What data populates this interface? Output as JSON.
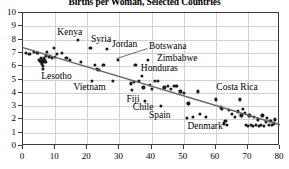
{
  "chart_data": {
    "type": "scatter",
    "title": "Births per Woman, Selected Countries",
    "xlabel": "",
    "ylabel": "",
    "xlim": [
      0,
      80
    ],
    "ylim": [
      0,
      10
    ],
    "xticks": [
      0,
      10,
      20,
      30,
      40,
      50,
      60,
      70,
      80
    ],
    "yticks": [
      0,
      1,
      2,
      3,
      4,
      5,
      6,
      7,
      8,
      9,
      10
    ],
    "grid": true,
    "legend": "none",
    "point_color": "#1a1a1a",
    "trendline_color": "#666666",
    "trendline": {
      "x": [
        0,
        80
      ],
      "y": [
        7.4,
        1.6
      ]
    },
    "points": [
      [
        1.0,
        7.0
      ],
      [
        2.0,
        6.9
      ],
      [
        3.5,
        7.1
      ],
      [
        4.5,
        7.0
      ],
      [
        5.0,
        6.5
      ],
      [
        5.2,
        6.4
      ],
      [
        5.5,
        6.3
      ],
      [
        5.6,
        6.6
      ],
      [
        5.8,
        6.2
      ],
      [
        6.0,
        6.5
      ],
      [
        6.1,
        6.3
      ],
      [
        6.2,
        6.0
      ],
      [
        6.3,
        5.8
      ],
      [
        6.4,
        6.4
      ],
      [
        6.5,
        6.6
      ],
      [
        6.8,
        6.5
      ],
      [
        7.0,
        6.3
      ],
      [
        7.2,
        6.8
      ],
      [
        7.5,
        7.1
      ],
      [
        8.0,
        6.7
      ],
      [
        8.5,
        6.8
      ],
      [
        9.0,
        6.6
      ],
      [
        9.5,
        7.4
      ],
      [
        10.0,
        6.7
      ],
      [
        10.5,
        6.9
      ],
      [
        12.0,
        7.0
      ],
      [
        13.5,
        6.6
      ],
      [
        14.5,
        6.5
      ],
      [
        17.0,
        8.0
      ],
      [
        18.0,
        6.3
      ],
      [
        21.0,
        7.4
      ],
      [
        22.5,
        6.1
      ],
      [
        23.0,
        5.8
      ],
      [
        23.5,
        5.7
      ],
      [
        21.5,
        4.9
      ],
      [
        25.0,
        6.1
      ],
      [
        26.0,
        7.3
      ],
      [
        28.0,
        4.9
      ],
      [
        29.5,
        6.5
      ],
      [
        33.5,
        4.7
      ],
      [
        34.0,
        4.2
      ],
      [
        34.5,
        4.8
      ],
      [
        35.0,
        6.1
      ],
      [
        36.0,
        4.9
      ],
      [
        37.0,
        5.3
      ],
      [
        37.5,
        4.4
      ],
      [
        38.0,
        3.4
      ],
      [
        39.0,
        6.5
      ],
      [
        39.5,
        4.6
      ],
      [
        40.0,
        4.3
      ],
      [
        41.0,
        4.9
      ],
      [
        42.0,
        4.9
      ],
      [
        43.0,
        3.0
      ],
      [
        44.0,
        4.4
      ],
      [
        45.0,
        4.5
      ],
      [
        46.0,
        4.3
      ],
      [
        47.0,
        4.5
      ],
      [
        47.5,
        4.5
      ],
      [
        48.0,
        4.5
      ],
      [
        49.0,
        4.1
      ],
      [
        50.0,
        4.0
      ],
      [
        51.0,
        2.1
      ],
      [
        51.5,
        3.2
      ],
      [
        53.0,
        2.2
      ],
      [
        54.5,
        4.1
      ],
      [
        55.0,
        2.4
      ],
      [
        57.0,
        2.2
      ],
      [
        60.0,
        3.5
      ],
      [
        61.5,
        2.9
      ],
      [
        62.0,
        2.8
      ],
      [
        62.5,
        1.7
      ],
      [
        63.0,
        1.9
      ],
      [
        63.5,
        1.6
      ],
      [
        64.0,
        2.7
      ],
      [
        65.0,
        2.4
      ],
      [
        66.0,
        2.2
      ],
      [
        67.0,
        2.6
      ],
      [
        67.5,
        3.5
      ],
      [
        68.0,
        2.3
      ],
      [
        68.5,
        2.8
      ],
      [
        69.0,
        2.5
      ],
      [
        69.5,
        1.6
      ],
      [
        70.0,
        1.5
      ],
      [
        70.5,
        2.3
      ],
      [
        71.0,
        1.6
      ],
      [
        71.5,
        1.5
      ],
      [
        72.0,
        2.2
      ],
      [
        72.5,
        1.6
      ],
      [
        73.0,
        2.0
      ],
      [
        73.5,
        1.5
      ],
      [
        74.0,
        1.6
      ],
      [
        74.5,
        2.3
      ],
      [
        75.0,
        1.5
      ],
      [
        75.5,
        1.8
      ],
      [
        76.0,
        2.1
      ],
      [
        76.5,
        1.6
      ],
      [
        77.0,
        1.9
      ],
      [
        77.5,
        1.6
      ],
      [
        78.0,
        1.7
      ],
      [
        78.5,
        2.0
      ]
    ],
    "annotations": [
      {
        "label": "Kenya",
        "x": 11.0,
        "y": 8.45,
        "align": "left"
      },
      {
        "label": "Syria",
        "x": 21.5,
        "y": 7.9,
        "align": "left"
      },
      {
        "label": "Jordan",
        "x": 28.0,
        "y": 7.55,
        "align": "left"
      },
      {
        "label": "Botswana",
        "x": 39.5,
        "y": 7.35,
        "align": "left"
      },
      {
        "label": "Zimbabwe",
        "x": 42.0,
        "y": 6.5,
        "align": "left"
      },
      {
        "label": "Honduras",
        "x": 37.0,
        "y": 5.75,
        "align": "left"
      },
      {
        "label": "Lesotho",
        "x": 6.0,
        "y": 5.1,
        "align": "left"
      },
      {
        "label": "Vietnam",
        "x": 16.0,
        "y": 4.3,
        "align": "left"
      },
      {
        "label": "Costa Rica",
        "x": 60.5,
        "y": 4.3,
        "align": "left"
      },
      {
        "label": "Fiji",
        "x": 32.5,
        "y": 3.4,
        "align": "left"
      },
      {
        "label": "Chile",
        "x": 34.5,
        "y": 2.75,
        "align": "left"
      },
      {
        "label": "Spain",
        "x": 39.5,
        "y": 2.15,
        "align": "left"
      },
      {
        "label": "Denmark",
        "x": 51.5,
        "y": 1.35,
        "align": "left"
      }
    ],
    "leader_lines": [
      {
        "from_x": 39.0,
        "from_y": 7.25,
        "to_x": 29.5,
        "to_y": 6.5
      }
    ]
  }
}
